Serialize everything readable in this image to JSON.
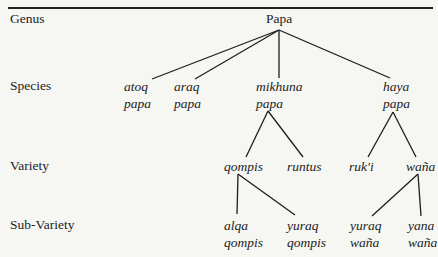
{
  "ranks": {
    "genus": "Genus",
    "species": "Species",
    "variety": "Variety",
    "sub_variety": "Sub-Variety"
  },
  "tree": {
    "root": "Papa",
    "species": [
      {
        "line1": "atoq",
        "line2": "papa"
      },
      {
        "line1": "araq",
        "line2": "papa"
      },
      {
        "line1": "mikhuna",
        "line2": "papa"
      },
      {
        "line1": "haya",
        "line2": "papa"
      }
    ],
    "varieties": [
      {
        "label": "qompis",
        "parent": "mikhuna papa"
      },
      {
        "label": "runtus",
        "parent": "mikhuna papa"
      },
      {
        "label": "ruk'i",
        "parent": "haya papa"
      },
      {
        "label": "waña",
        "parent": "haya papa"
      }
    ],
    "sub_varieties": [
      {
        "line1": "alqa",
        "line2": "qompis",
        "parent": "qompis"
      },
      {
        "line1": "yuraq",
        "line2": "qompis",
        "parent": "qompis"
      },
      {
        "line1": "yuraq",
        "line2": "waña",
        "parent": "waña"
      },
      {
        "line1": "yana",
        "line2": "waña",
        "parent": "waña"
      }
    ]
  }
}
